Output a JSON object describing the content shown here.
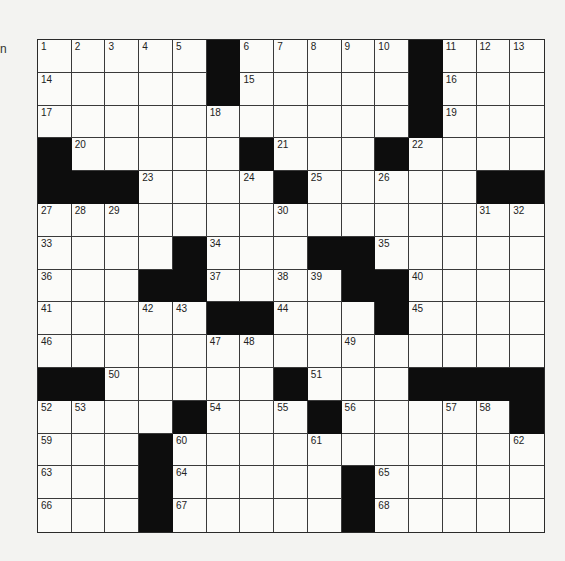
{
  "margin_glyph": "n",
  "puzzle": {
    "rows": 15,
    "cols": 15,
    "colors": {
      "block": "#0d0d0d",
      "cell": "#fbfbf9",
      "line": "#3a3a3a",
      "paper": "#f3f3f1"
    },
    "grid": [
      [
        "1",
        "2",
        "3",
        "4",
        "5",
        "#",
        "6",
        "7",
        "8",
        "9",
        "10",
        "#",
        "11",
        "12",
        "13"
      ],
      [
        "14",
        "",
        "",
        "",
        "",
        "#",
        "15",
        "",
        "",
        "",
        "",
        "#",
        "16",
        "",
        ""
      ],
      [
        "17",
        "",
        "",
        "",
        "",
        "18",
        "",
        "",
        "",
        "",
        "",
        "#",
        "19",
        "",
        ""
      ],
      [
        "#",
        "20",
        "",
        "",
        "",
        "",
        "#",
        "21",
        "",
        "",
        "#",
        "22",
        "",
        "",
        ""
      ],
      [
        "#",
        "#",
        "#",
        "23",
        "",
        "",
        "24",
        "#",
        "25",
        "",
        "26",
        "",
        "",
        "#",
        "#"
      ],
      [
        "27",
        "28",
        "29",
        "",
        "",
        "",
        "",
        "30",
        "",
        "",
        "",
        "",
        "",
        "31",
        "32"
      ],
      [
        "33",
        "",
        "",
        "",
        "#",
        "34",
        "",
        "",
        "#",
        "#",
        "35",
        "",
        "",
        "",
        ""
      ],
      [
        "36",
        "",
        "",
        "#",
        "#",
        "37",
        "",
        "38",
        "39",
        "#",
        "#",
        "40",
        "",
        "",
        ""
      ],
      [
        "41",
        "",
        "",
        "42",
        "43",
        "#",
        "#",
        "44",
        "",
        "",
        "#",
        "45",
        "",
        "",
        ""
      ],
      [
        "46",
        "",
        "",
        "",
        "",
        "47",
        "48",
        "",
        "",
        "49",
        "",
        "",
        "",
        "",
        ""
      ],
      [
        "#",
        "#",
        "50",
        "",
        "",
        "",
        "",
        "#",
        "51",
        "",
        "",
        "#",
        "#",
        "#",
        "#"
      ],
      [
        "52",
        "53",
        "",
        "",
        "#",
        "54",
        "",
        "55",
        "#",
        "56",
        "",
        "",
        "57",
        "58",
        "#"
      ],
      [
        "59",
        "",
        "",
        "#",
        "60",
        "",
        "",
        "",
        "61",
        "",
        "",
        "",
        "",
        "",
        "62"
      ],
      [
        "63",
        "",
        "",
        "#",
        "64",
        "",
        "",
        "",
        "",
        "#",
        "65",
        "",
        "",
        "",
        ""
      ],
      [
        "66",
        "",
        "",
        "#",
        "67",
        "",
        "",
        "",
        "",
        "#",
        "68",
        "",
        "",
        "",
        ""
      ]
    ]
  }
}
